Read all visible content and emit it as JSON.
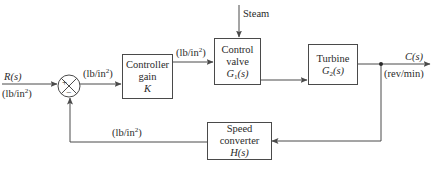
{
  "diagram": {
    "type": "feedback-control-block-diagram",
    "input": {
      "symbol": "R(s)",
      "unit": "(lb/in",
      "unit_exp": "2",
      "unit_close": ")"
    },
    "output": {
      "symbol": "C(s)",
      "unit": "(rev/min)"
    },
    "summing_junction": {
      "plus": "+",
      "minus": "−"
    },
    "signal_after_sum": {
      "unit": "(lb/in",
      "unit_exp": "2",
      "unit_close": ")"
    },
    "signal_after_controller": {
      "unit": "(lb/in",
      "unit_exp": "2",
      "unit_close": ")"
    },
    "feedback_signal": {
      "unit": "(lb/in",
      "unit_exp": "2",
      "unit_close": ")"
    },
    "disturbance": {
      "label": "Steam"
    },
    "blocks": {
      "controller": {
        "line1": "Controller",
        "line2": "gain",
        "tf": "K"
      },
      "valve": {
        "line1": "Control",
        "line2": "valve",
        "tf_sym": "G",
        "tf_sub": "1",
        "tf_arg": "(s)"
      },
      "turbine": {
        "line1": "Turbine",
        "tf_sym": "G",
        "tf_sub": "2",
        "tf_arg": "(s)"
      },
      "sensor": {
        "line1": "Speed converter",
        "tf": "H(s)"
      }
    },
    "colors": {
      "line": "#4a4a4a",
      "text": "#2a2a2a",
      "background": "#ffffff"
    }
  }
}
